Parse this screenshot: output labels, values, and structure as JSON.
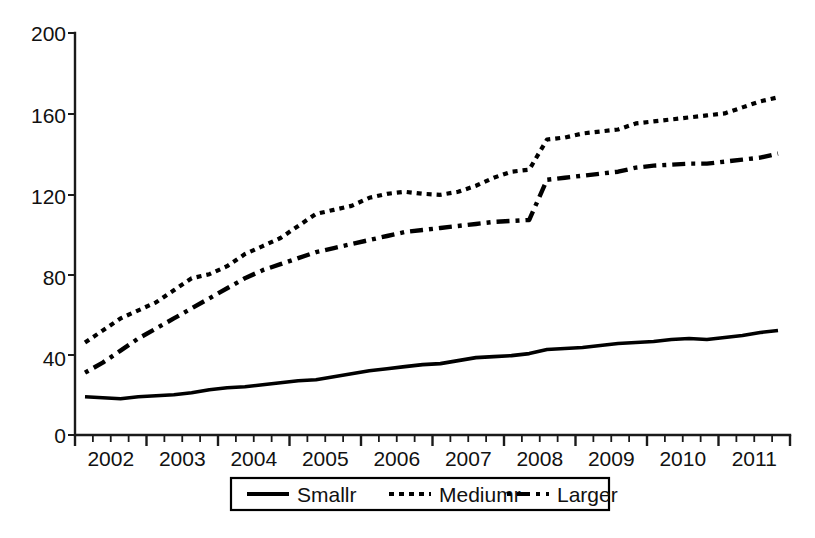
{
  "chart_data": {
    "type": "line",
    "title": "",
    "xlabel": "",
    "ylabel": "",
    "ylim": [
      0,
      200
    ],
    "yticks": [
      0,
      40,
      80,
      120,
      160,
      200
    ],
    "ytick_labels": [
      "0",
      "40",
      "80",
      "120",
      "160",
      "200"
    ],
    "xlim": [
      "2002Q1",
      "2011Q4"
    ],
    "xtick_labels": [
      "2002",
      "2003",
      "2004",
      "2005",
      "2006",
      "2007",
      "2008",
      "2009",
      "2010",
      "2011"
    ],
    "x_minor_ticks_per_year": 4,
    "grid": false,
    "legend_position": "bottom-center",
    "x": [
      "2002Q1",
      "2002Q2",
      "2002Q3",
      "2002Q4",
      "2003Q1",
      "2003Q2",
      "2003Q3",
      "2003Q4",
      "2004Q1",
      "2004Q2",
      "2004Q3",
      "2004Q4",
      "2005Q1",
      "2005Q2",
      "2005Q3",
      "2005Q4",
      "2006Q1",
      "2006Q2",
      "2006Q3",
      "2006Q4",
      "2007Q1",
      "2007Q2",
      "2007Q3",
      "2007Q4",
      "2008Q1",
      "2008Q2",
      "2008Q3",
      "2008Q4",
      "2009Q1",
      "2009Q2",
      "2009Q3",
      "2009Q4",
      "2010Q1",
      "2010Q2",
      "2010Q3",
      "2010Q4",
      "2011Q1",
      "2011Q2",
      "2011Q3",
      "2011Q4"
    ],
    "series": [
      {
        "name": "Smallr",
        "style": "solid",
        "color": "#000000",
        "values": [
          19,
          18.5,
          18,
          19,
          19.5,
          20,
          21,
          22.5,
          23.5,
          24,
          25,
          26,
          27,
          27.5,
          29,
          30.5,
          32,
          33,
          34,
          35,
          35.5,
          37,
          38.5,
          39,
          39.5,
          40.5,
          42.5,
          43,
          43.5,
          44.5,
          45.5,
          46,
          46.5,
          47.5,
          48,
          47.5,
          48.5,
          49.5,
          51,
          52
        ]
      },
      {
        "name": "Mediumr",
        "style": "dotted",
        "color": "#000000",
        "values": [
          46,
          52,
          58,
          62,
          66,
          72,
          78,
          80,
          84,
          90,
          94,
          98,
          104,
          110,
          112,
          114,
          118,
          120,
          121,
          120,
          119.5,
          121,
          124,
          128,
          131,
          132,
          147,
          148,
          150,
          151,
          152,
          155,
          156,
          157,
          158,
          159,
          160,
          163,
          166,
          168
        ]
      },
      {
        "name": "Larger",
        "style": "dashed",
        "color": "#000000",
        "values": [
          31,
          36,
          42,
          48,
          53,
          58,
          63,
          68,
          73,
          78,
          82,
          85,
          88,
          91,
          93,
          95,
          97,
          99,
          101,
          102,
          103,
          104,
          105,
          106,
          106.5,
          107,
          127,
          128,
          129,
          130,
          131,
          133,
          134,
          134.5,
          135,
          135,
          136,
          137,
          138,
          140
        ]
      }
    ]
  },
  "legend": {
    "items": [
      {
        "label": "Smallr",
        "style": "solid"
      },
      {
        "label": "Mediumr",
        "style": "dotted"
      },
      {
        "label": "Larger",
        "style": "dashed"
      }
    ]
  },
  "axes": {
    "y_tick_labels": [
      "200",
      "160",
      "120",
      "80",
      "40",
      "0"
    ],
    "x_tick_labels": [
      "2002",
      "2003",
      "2004",
      "2005",
      "2006",
      "2007",
      "2008",
      "2009",
      "2010",
      "2011"
    ]
  }
}
